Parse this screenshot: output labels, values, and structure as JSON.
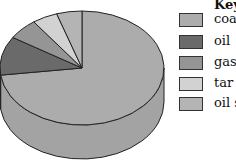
{
  "chart_data": {
    "type": "pie",
    "style": "3d",
    "title": "",
    "legend_title": "Key",
    "legend_position": "right",
    "categories": [
      "coal",
      "oil",
      "gas",
      "tar",
      "oil shale"
    ],
    "values": [
      73,
      11,
      6,
      5,
      5
    ],
    "colors": [
      "#acacac",
      "#6a6a6a",
      "#959595",
      "#d2d2d2",
      "#b4b4b4"
    ]
  },
  "legend": {
    "title": "Key",
    "items": [
      {
        "label": "coa"
      },
      {
        "label": "oil"
      },
      {
        "label": "gas"
      },
      {
        "label": "tar"
      },
      {
        "label": "oil s"
      }
    ]
  }
}
